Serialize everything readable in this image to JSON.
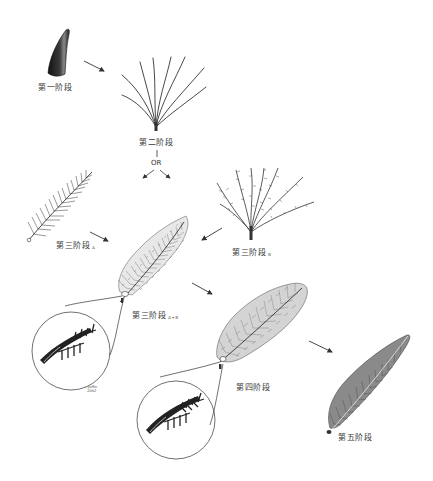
{
  "diagram": {
    "type": "feather-evolution-stages",
    "stages": [
      {
        "id": "stage1",
        "label": "第一阶段",
        "subscript": "",
        "depiction": "hollow cone / tubular filament"
      },
      {
        "id": "stage2",
        "label": "第二阶段",
        "subscript": "",
        "depiction": "tuft of unbranched barbs"
      },
      {
        "id": "stage3a",
        "label": "第三阶段",
        "subscript": "A",
        "depiction": "rachis with barbs (pinnate)"
      },
      {
        "id": "stage3b",
        "label": "第三阶段",
        "subscript": "B",
        "depiction": "tuft of barbs with barbules"
      },
      {
        "id": "stage3ab",
        "label": "第三阶段",
        "subscript": "A+B",
        "depiction": "rachis, barbs and barbules"
      },
      {
        "id": "stage4",
        "label": "第四阶段",
        "subscript": "",
        "depiction": "closed symmetric vane with hooked barbules"
      },
      {
        "id": "stage5",
        "label": "第五阶段",
        "subscript": "",
        "depiction": "asymmetric flight feather"
      }
    ],
    "branch_label": "OR",
    "arrows": [
      {
        "from": "stage1",
        "to": "stage2"
      },
      {
        "from": "stage2",
        "to": "stage3a"
      },
      {
        "from": "stage2",
        "to": "stage3b"
      },
      {
        "from": "stage3a",
        "to": "stage3ab"
      },
      {
        "from": "stage3b",
        "to": "stage3ab"
      },
      {
        "from": "stage3ab",
        "to": "stage4"
      },
      {
        "from": "stage4",
        "to": "stage5"
      }
    ],
    "insets": [
      {
        "of": "stage3ab",
        "depiction": "magnified barbules"
      },
      {
        "of": "stage4",
        "depiction": "magnified hooked barbules"
      }
    ],
    "signature": "illegible artist signature"
  }
}
